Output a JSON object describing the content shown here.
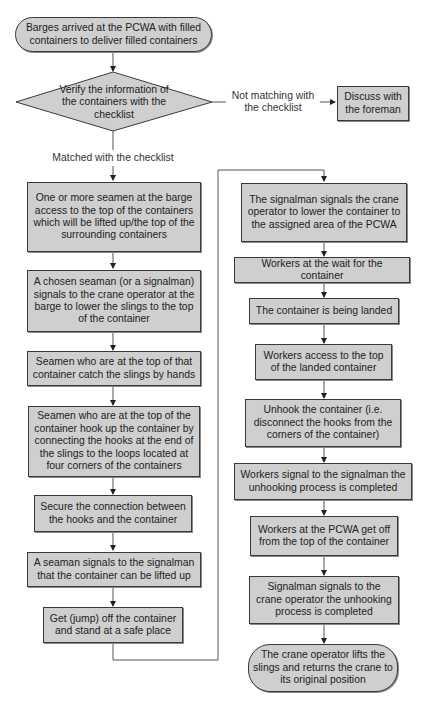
{
  "start": {
    "text": "Barges arrived at the PCWA with filled containers to deliver filled containers"
  },
  "decision": {
    "text": "Verify the information of the containers with the checklist"
  },
  "branch_no": {
    "label": "Not matching with the checklist",
    "target": "Discuss with the foreman"
  },
  "branch_yes": {
    "label": "Matched with the checklist"
  },
  "left_steps": [
    "One or more seamen at the barge access to the top of the containers which will be lifted up/the top of the surrounding containers",
    "A chosen seaman (or a signalman) signals to the crane operator at the barge to lower the slings to the top of the container",
    "Seamen who are at the top of that container catch the slings by hands",
    "Seamen who are at the top of the container hook up the container by connecting the hooks at the end of the slings to the loops located at four corners of the containers",
    "Secure the connection between the hooks and the container",
    "A seaman signals to the signalman that the container can be lifted up",
    "Get (jump) off the container and stand at a safe place"
  ],
  "right_steps": [
    "The signalman signals the crane operator to lower the container to the assigned area of the PCWA",
    "Workers at the wait for the container",
    "The container is being landed",
    "Workers access to the top of the landed container",
    "Unhook the container (i.e. disconnect the hooks from the corners of the container)",
    "Workers signal to the signalman the unhooking process is completed",
    "Workers at the PCWA get off from the top of the container",
    "Signalman signals to the crane operator the unhooking process is completed"
  ],
  "end": {
    "text": "The crane operator lifts the slings and returns the crane to its original position"
  }
}
